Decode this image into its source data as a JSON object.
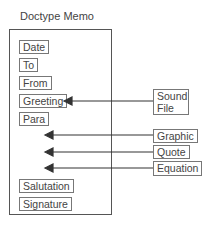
{
  "title": "Doctype Memo",
  "container": {
    "fields": [
      {
        "label": "Date"
      },
      {
        "label": "To"
      },
      {
        "label": "From"
      },
      {
        "label": "Greeting"
      },
      {
        "label": "Para"
      },
      {
        "label": "Salutation"
      },
      {
        "label": "Signature"
      }
    ]
  },
  "external": [
    {
      "label": "Sound\nFile",
      "target": "Greeting"
    },
    {
      "label": "Graphic",
      "target": "insertion-point-1"
    },
    {
      "label": "Quote",
      "target": "insertion-point-2"
    },
    {
      "label": "Equation",
      "target": "insertion-point-3"
    }
  ]
}
